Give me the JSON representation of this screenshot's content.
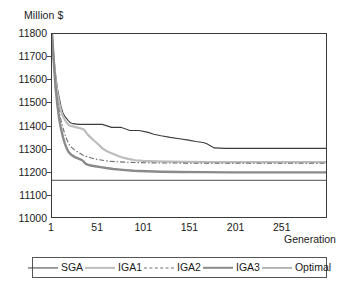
{
  "chart_data": {
    "type": "line",
    "title": "",
    "xlabel": "Generation",
    "ylabel": "Million $",
    "xlim": [
      1,
      300
    ],
    "ylim": [
      11000,
      11800
    ],
    "ytick_labels": [
      "11800",
      "11700",
      "11600",
      "11500",
      "11400",
      "11300",
      "11200",
      "11100",
      "11000"
    ],
    "ytick_values": [
      11800,
      11700,
      11600,
      11500,
      11400,
      11300,
      11200,
      11100,
      11000
    ],
    "xtick_labels": [
      "1",
      "51",
      "101",
      "151",
      "201",
      "251"
    ],
    "xtick_values": [
      1,
      51,
      101,
      151,
      201,
      251
    ],
    "grid": false,
    "legend_position": "below",
    "series": [
      {
        "name": "SGA",
        "color": "#3c3c3c",
        "width": 1.1,
        "dash": "none",
        "x": [
          1,
          3,
          5,
          7,
          9,
          11,
          13,
          15,
          17,
          19,
          21,
          24,
          30,
          38,
          46,
          56,
          66,
          76,
          86,
          96,
          106,
          112,
          120,
          130,
          140,
          150,
          158,
          166,
          170,
          178,
          190,
          205,
          225,
          250,
          275,
          300
        ],
        "y": [
          11800,
          11700,
          11620,
          11560,
          11520,
          11480,
          11455,
          11440,
          11430,
          11420,
          11412,
          11408,
          11405,
          11405,
          11405,
          11405,
          11392,
          11392,
          11378,
          11378,
          11370,
          11362,
          11355,
          11348,
          11342,
          11336,
          11330,
          11326,
          11320,
          11302,
          11300,
          11300,
          11300,
          11300,
          11300,
          11300
        ]
      },
      {
        "name": "IGA1",
        "color": "#bdbdbd",
        "width": 2.2,
        "dash": "none",
        "x": [
          1,
          3,
          5,
          7,
          9,
          11,
          13,
          15,
          17,
          20,
          24,
          28,
          32,
          36,
          40,
          44,
          48,
          52,
          56,
          60,
          64,
          70,
          76,
          84,
          92,
          100,
          115,
          130,
          150,
          175,
          200,
          230,
          260,
          300
        ],
        "y": [
          11800,
          11690,
          11600,
          11540,
          11495,
          11462,
          11440,
          11425,
          11412,
          11400,
          11396,
          11392,
          11388,
          11382,
          11360,
          11345,
          11330,
          11316,
          11300,
          11290,
          11282,
          11272,
          11262,
          11254,
          11248,
          11245,
          11243,
          11242,
          11241,
          11240,
          11240,
          11240,
          11240,
          11240
        ]
      },
      {
        "name": "IGA2",
        "color": "#6e6e6e",
        "width": 1.1,
        "dash": "5,2,1.5,2",
        "x": [
          1,
          3,
          5,
          7,
          9,
          11,
          13,
          15,
          17,
          19,
          22,
          26,
          30,
          34,
          38,
          44,
          50,
          56,
          62,
          70,
          80,
          92,
          104,
          118,
          135,
          155,
          180,
          210,
          240,
          270,
          300
        ],
        "y": [
          11800,
          11680,
          11580,
          11510,
          11460,
          11420,
          11390,
          11362,
          11340,
          11322,
          11305,
          11292,
          11282,
          11272,
          11265,
          11258,
          11252,
          11248,
          11244,
          11242,
          11240,
          11238,
          11237,
          11236,
          11236,
          11235,
          11235,
          11235,
          11235,
          11235,
          11235
        ]
      },
      {
        "name": "IGA3",
        "color": "#8a8a8a",
        "width": 2.4,
        "dash": "none",
        "x": [
          1,
          3,
          5,
          7,
          9,
          11,
          13,
          15,
          17,
          19,
          22,
          26,
          30,
          34,
          38,
          42,
          48,
          54,
          60,
          68,
          78,
          90,
          104,
          120,
          140,
          165,
          195,
          225,
          260,
          300
        ],
        "y": [
          11800,
          11670,
          11560,
          11485,
          11425,
          11382,
          11348,
          11322,
          11300,
          11285,
          11272,
          11262,
          11255,
          11248,
          11232,
          11226,
          11222,
          11218,
          11214,
          11210,
          11206,
          11202,
          11200,
          11198,
          11197,
          11196,
          11195,
          11195,
          11195,
          11195
        ]
      },
      {
        "name": "Optimal",
        "color": "#707070",
        "width": 1.1,
        "dash": "none",
        "x": [
          1,
          300
        ],
        "y": [
          11160,
          11160
        ]
      }
    ]
  },
  "axes": {
    "ylabel": "Million $",
    "xlabel": "Generation"
  },
  "legend": {
    "items": [
      {
        "label": "SGA"
      },
      {
        "label": "IGA1"
      },
      {
        "label": "IGA2"
      },
      {
        "label": "IGA3"
      },
      {
        "label": "Optimal"
      }
    ]
  }
}
